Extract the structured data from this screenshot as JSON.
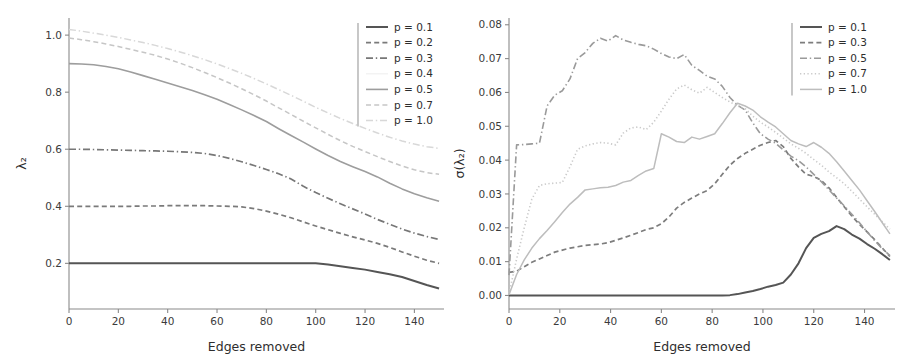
{
  "figure": {
    "panel_count": 2,
    "background_color": "#ffffff"
  },
  "chart_data": [
    {
      "type": "line",
      "panel": "left",
      "title": "",
      "xlabel": "Edges removed",
      "ylabel": "λ₂",
      "xlim": [
        0,
        152
      ],
      "ylim": [
        0.04,
        1.06
      ],
      "grid": false,
      "legend_position": "upper right",
      "xticks": [
        0,
        20,
        40,
        60,
        80,
        100,
        120,
        140
      ],
      "xticklabels": [
        "0",
        "20",
        "40",
        "60",
        "80",
        "100",
        "120",
        "140"
      ],
      "yticks": [
        0.2,
        0.4,
        0.6,
        0.8,
        1.0
      ],
      "yticklabels": [
        "0.2",
        "0.4",
        "0.6",
        "0.8",
        "1.0"
      ],
      "x": [
        0,
        5,
        10,
        15,
        20,
        25,
        30,
        35,
        40,
        45,
        50,
        55,
        60,
        65,
        70,
        75,
        80,
        85,
        90,
        95,
        100,
        105,
        110,
        115,
        120,
        125,
        130,
        135,
        140,
        145,
        150
      ],
      "series": [
        {
          "name": "p = 0.1",
          "legend_label": "p = 0.1",
          "color": "#555555",
          "dash": "solid",
          "width": 2.0,
          "values": [
            0.2,
            0.2,
            0.2,
            0.2,
            0.2,
            0.2,
            0.2,
            0.2,
            0.2,
            0.2,
            0.2,
            0.2,
            0.2,
            0.2,
            0.2,
            0.2,
            0.2,
            0.2,
            0.2,
            0.2,
            0.2,
            0.196,
            0.19,
            0.184,
            0.178,
            0.17,
            0.162,
            0.152,
            0.138,
            0.124,
            0.112
          ]
        },
        {
          "name": "p = 0.2",
          "legend_label": "p = 0.2",
          "color": "#7a7a7a",
          "dash": "dashed",
          "width": 1.7,
          "values": [
            0.4,
            0.4,
            0.4,
            0.4,
            0.4,
            0.4,
            0.401,
            0.401,
            0.402,
            0.402,
            0.402,
            0.402,
            0.401,
            0.4,
            0.398,
            0.392,
            0.383,
            0.372,
            0.36,
            0.345,
            0.331,
            0.318,
            0.305,
            0.293,
            0.282,
            0.27,
            0.256,
            0.24,
            0.225,
            0.211,
            0.2
          ]
        },
        {
          "name": "p = 0.3",
          "legend_label": "p = 0.3",
          "color": "#777777",
          "dash": "dashdot",
          "width": 1.7,
          "values": [
            0.6,
            0.6,
            0.599,
            0.598,
            0.597,
            0.596,
            0.595,
            0.594,
            0.593,
            0.591,
            0.589,
            0.585,
            0.578,
            0.568,
            0.556,
            0.543,
            0.529,
            0.514,
            0.496,
            0.47,
            0.448,
            0.428,
            0.409,
            0.391,
            0.373,
            0.354,
            0.337,
            0.32,
            0.306,
            0.294,
            0.284
          ]
        },
        {
          "name": "p = 0.4",
          "legend_label": "p = 0.4",
          "color": "#f2f2f2",
          "dash": "solid",
          "width": 1.4,
          "values": [
            null,
            null,
            null,
            null,
            null,
            null,
            null,
            null,
            null,
            null,
            null,
            null,
            null,
            null,
            null,
            null,
            null,
            null,
            null,
            null,
            null,
            null,
            null,
            null,
            null,
            null,
            null,
            null,
            null,
            null,
            null
          ]
        },
        {
          "name": "p = 0.5",
          "legend_label": "p = 0.5",
          "color": "#9d9d9d",
          "dash": "solid",
          "width": 1.6,
          "values": [
            0.9,
            0.899,
            0.896,
            0.89,
            0.882,
            0.871,
            0.858,
            0.845,
            0.832,
            0.819,
            0.806,
            0.791,
            0.775,
            0.757,
            0.738,
            0.718,
            0.697,
            0.672,
            0.648,
            0.625,
            0.601,
            0.578,
            0.557,
            0.539,
            0.522,
            0.503,
            0.481,
            0.461,
            0.444,
            0.43,
            0.418
          ]
        },
        {
          "name": "p = 0.7",
          "legend_label": "p = 0.7",
          "color": "#c6c6c6",
          "dash": "dashed",
          "width": 1.5,
          "values": [
            0.99,
            0.984,
            0.977,
            0.969,
            0.96,
            0.95,
            0.94,
            0.929,
            0.916,
            0.902,
            0.886,
            0.869,
            0.851,
            0.832,
            0.812,
            0.791,
            0.769,
            0.745,
            0.722,
            0.698,
            0.675,
            0.652,
            0.63,
            0.61,
            0.592,
            0.574,
            0.557,
            0.541,
            0.528,
            0.518,
            0.512
          ]
        },
        {
          "name": "p = 1.0",
          "legend_label": "p = 1.0",
          "color": "#d8d8d8",
          "dash": "dashdot",
          "width": 1.5,
          "values": [
            1.02,
            1.014,
            1.007,
            1.0,
            0.992,
            0.983,
            0.974,
            0.964,
            0.953,
            0.941,
            0.928,
            0.914,
            0.899,
            0.883,
            0.866,
            0.848,
            0.829,
            0.809,
            0.789,
            0.768,
            0.747,
            0.727,
            0.708,
            0.69,
            0.673,
            0.657,
            0.642,
            0.629,
            0.618,
            0.609,
            0.603
          ]
        }
      ]
    },
    {
      "type": "line",
      "panel": "right",
      "title": "",
      "xlabel": "Edges removed",
      "ylabel": "σ(λ₂)",
      "xlim": [
        0,
        152
      ],
      "ylim": [
        -0.004,
        0.082
      ],
      "grid": false,
      "legend_position": "upper right",
      "xticks": [
        0,
        20,
        40,
        60,
        80,
        100,
        120,
        140
      ],
      "xticklabels": [
        "0",
        "20",
        "40",
        "60",
        "80",
        "100",
        "120",
        "140"
      ],
      "yticks": [
        0.0,
        0.01,
        0.02,
        0.03,
        0.04,
        0.05,
        0.06,
        0.07,
        0.08
      ],
      "yticklabels": [
        "0.00",
        "0.01",
        "0.02",
        "0.03",
        "0.04",
        "0.05",
        "0.06",
        "0.07",
        "0.08"
      ],
      "x": [
        0,
        3,
        6,
        9,
        12,
        15,
        18,
        21,
        24,
        27,
        30,
        33,
        36,
        39,
        42,
        45,
        48,
        51,
        54,
        57,
        60,
        63,
        66,
        69,
        72,
        75,
        78,
        81,
        84,
        87,
        90,
        93,
        96,
        99,
        102,
        105,
        108,
        111,
        114,
        117,
        120,
        123,
        126,
        129,
        132,
        135,
        138,
        141,
        144,
        147,
        150
      ],
      "series": [
        {
          "name": "p = 0.1",
          "legend_label": "p = 0.1",
          "color": "#555555",
          "dash": "solid",
          "width": 2.0,
          "values": [
            0.0,
            0.0,
            0.0,
            0.0,
            0.0,
            0.0,
            0.0,
            0.0,
            0.0,
            0.0,
            0.0,
            0.0,
            0.0,
            0.0,
            0.0,
            0.0,
            0.0,
            0.0,
            0.0,
            0.0,
            0.0,
            0.0,
            0.0,
            0.0,
            0.0,
            0.0,
            0.0,
            0.0,
            0.0,
            0.0001,
            0.0004,
            0.0009,
            0.0013,
            0.0019,
            0.0026,
            0.0031,
            0.0038,
            0.0062,
            0.0095,
            0.014,
            0.017,
            0.0182,
            0.019,
            0.0205,
            0.0196,
            0.018,
            0.0168,
            0.0152,
            0.0138,
            0.0122,
            0.0105
          ]
        },
        {
          "name": "p = 0.3",
          "legend_label": "p = 0.3",
          "color": "#7d7d7d",
          "dash": "dashed",
          "width": 1.7,
          "values": [
            0.0068,
            0.0072,
            0.0085,
            0.0098,
            0.0108,
            0.0118,
            0.0128,
            0.0134,
            0.014,
            0.0144,
            0.0148,
            0.015,
            0.0152,
            0.0156,
            0.0163,
            0.017,
            0.0178,
            0.0186,
            0.0195,
            0.02,
            0.0212,
            0.0232,
            0.0258,
            0.0275,
            0.0288,
            0.03,
            0.031,
            0.033,
            0.0358,
            0.0385,
            0.0405,
            0.042,
            0.0432,
            0.0444,
            0.0452,
            0.0458,
            0.044,
            0.0405,
            0.038,
            0.0358,
            0.0352,
            0.034,
            0.0318,
            0.029,
            0.0262,
            0.0235,
            0.021,
            0.0188,
            0.0165,
            0.014,
            0.0115
          ]
        },
        {
          "name": "p = 0.5",
          "legend_label": "p = 0.5",
          "color": "#9a9a9a",
          "dash": "dashdot",
          "width": 1.6,
          "values": [
            0.006,
            0.0445,
            0.0446,
            0.0448,
            0.045,
            0.056,
            0.0592,
            0.0605,
            0.064,
            0.07,
            0.0718,
            0.0745,
            0.076,
            0.0752,
            0.0768,
            0.0755,
            0.0748,
            0.0742,
            0.0738,
            0.0728,
            0.0715,
            0.0705,
            0.07,
            0.0712,
            0.068,
            0.0665,
            0.0648,
            0.064,
            0.0618,
            0.0585,
            0.0562,
            0.0548,
            0.051,
            0.0478,
            0.0462,
            0.045,
            0.043,
            0.0412,
            0.0398,
            0.038,
            0.0358,
            0.0336,
            0.0312,
            0.0288,
            0.0265,
            0.024,
            0.0215,
            0.0188,
            0.0162,
            0.0138,
            0.0118
          ]
        },
        {
          "name": "p = 0.7",
          "legend_label": "p = 0.7",
          "color": "#cacaca",
          "dash": "dotted",
          "width": 1.6,
          "values": [
            0.0005,
            0.0108,
            0.02,
            0.0285,
            0.0325,
            0.033,
            0.0332,
            0.0334,
            0.038,
            0.0432,
            0.0442,
            0.0448,
            0.0452,
            0.045,
            0.0445,
            0.048,
            0.0495,
            0.0498,
            0.049,
            0.0512,
            0.0545,
            0.058,
            0.061,
            0.0622,
            0.0608,
            0.0598,
            0.0615,
            0.06,
            0.0585,
            0.0572,
            0.056,
            0.0552,
            0.053,
            0.0512,
            0.0498,
            0.0482,
            0.0465,
            0.0448,
            0.0435,
            0.042,
            0.0402,
            0.0385,
            0.0365,
            0.0348,
            0.033,
            0.0308,
            0.0285,
            0.0262,
            0.024,
            0.0218,
            0.0196
          ]
        },
        {
          "name": "p = 1.0",
          "legend_label": "p = 1.0",
          "color": "#bdbdbd",
          "dash": "solid",
          "width": 1.5,
          "values": [
            0.0002,
            0.0062,
            0.0105,
            0.014,
            0.0168,
            0.0192,
            0.0218,
            0.0245,
            0.027,
            0.029,
            0.0312,
            0.0315,
            0.0318,
            0.032,
            0.0325,
            0.0335,
            0.034,
            0.0355,
            0.0368,
            0.0375,
            0.0478,
            0.0468,
            0.0455,
            0.0452,
            0.0468,
            0.0462,
            0.047,
            0.0478,
            0.0508,
            0.054,
            0.0568,
            0.056,
            0.0548,
            0.0528,
            0.0512,
            0.0498,
            0.0478,
            0.0458,
            0.0448,
            0.044,
            0.0452,
            0.0438,
            0.042,
            0.0395,
            0.0368,
            0.034,
            0.0312,
            0.028,
            0.0248,
            0.0215,
            0.0182
          ]
        }
      ]
    }
  ]
}
